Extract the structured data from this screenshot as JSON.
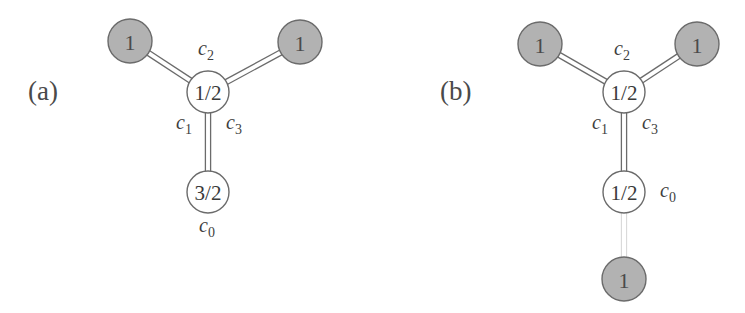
{
  "figure": {
    "background_color": "#ffffff",
    "stroke_color": "#6b6b6b",
    "gray_node_fill": "#b2b2b2",
    "white_node_fill": "#ffffff",
    "text_color": "#3a3a3a",
    "faint_stroke_color": "#d9d9d9"
  },
  "panels": [
    {
      "id": "a",
      "label": "(a)",
      "label_x": 28,
      "label_y": 100,
      "nodes": [
        {
          "id": "a-top-left",
          "value": "1",
          "type": "filled",
          "cx": 130,
          "cy": 41,
          "r": 22
        },
        {
          "id": "a-top-right",
          "value": "1",
          "type": "filled",
          "cx": 300,
          "cy": 42,
          "r": 22
        },
        {
          "id": "a-center",
          "value": "1/2",
          "type": "open",
          "cx": 208,
          "cy": 92,
          "r": 21
        },
        {
          "id": "a-bottom",
          "value": "3/2",
          "type": "open",
          "cx": 208,
          "cy": 192,
          "r": 21
        }
      ],
      "edges": [
        {
          "id": "a-edge-c2-left",
          "from": "a-top-left",
          "to": "a-center",
          "style": "double"
        },
        {
          "id": "a-edge-c2-right",
          "from": "a-top-right",
          "to": "a-center",
          "style": "double"
        },
        {
          "id": "a-edge-c0",
          "from": "a-center",
          "to": "a-bottom",
          "style": "double"
        }
      ],
      "edge_labels": [
        {
          "id": "a-label-c2",
          "base": "c",
          "sub": "2",
          "x": 206,
          "y": 55
        },
        {
          "id": "a-label-c1",
          "base": "c",
          "sub": "1",
          "x": 184,
          "y": 129
        },
        {
          "id": "a-label-c3",
          "base": "c",
          "sub": "3",
          "x": 234,
          "y": 129
        },
        {
          "id": "a-label-c0",
          "base": "c",
          "sub": "0",
          "x": 207,
          "y": 232
        }
      ]
    },
    {
      "id": "b",
      "label": "(b)",
      "label_x": 440,
      "label_y": 100,
      "nodes": [
        {
          "id": "b-top-left",
          "value": "1",
          "type": "filled",
          "cx": 540,
          "cy": 44,
          "r": 22
        },
        {
          "id": "b-top-right",
          "value": "1",
          "type": "filled",
          "cx": 697,
          "cy": 44,
          "r": 22
        },
        {
          "id": "b-center",
          "value": "1/2",
          "type": "open",
          "cx": 624,
          "cy": 92,
          "r": 21
        },
        {
          "id": "b-middle",
          "value": "1/2",
          "type": "open",
          "cx": 624,
          "cy": 192,
          "r": 21
        },
        {
          "id": "b-bottom",
          "value": "1",
          "type": "filled",
          "cx": 624,
          "cy": 279,
          "r": 22
        }
      ],
      "edges": [
        {
          "id": "b-edge-c2-left",
          "from": "b-top-left",
          "to": "b-center",
          "style": "double"
        },
        {
          "id": "b-edge-c2-right",
          "from": "b-top-right",
          "to": "b-center",
          "style": "double"
        },
        {
          "id": "b-edge-c0",
          "from": "b-center",
          "to": "b-middle",
          "style": "double"
        },
        {
          "id": "b-edge-faint",
          "from": "b-middle",
          "to": "b-bottom",
          "style": "double-faint"
        }
      ],
      "edge_labels": [
        {
          "id": "b-label-c2",
          "base": "c",
          "sub": "2",
          "x": 622,
          "y": 55
        },
        {
          "id": "b-label-c1",
          "base": "c",
          "sub": "1",
          "x": 600,
          "y": 129
        },
        {
          "id": "b-label-c3",
          "base": "c",
          "sub": "3",
          "x": 650,
          "y": 129
        },
        {
          "id": "b-label-c0",
          "base": "c",
          "sub": "0",
          "x": 668,
          "y": 197
        }
      ]
    }
  ]
}
